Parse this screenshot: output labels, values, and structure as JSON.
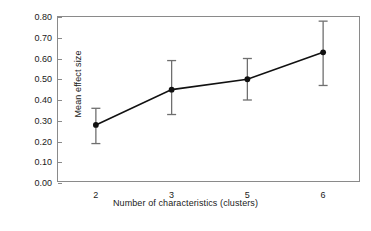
{
  "chart_data": {
    "type": "line",
    "title": "",
    "xlabel": "Number of characteristics (clusters)",
    "ylabel": "Mean effect size",
    "categories": [
      "2",
      "3",
      "5",
      "6"
    ],
    "values": [
      0.28,
      0.45,
      0.5,
      0.63
    ],
    "error_low": [
      0.19,
      0.33,
      0.4,
      0.47
    ],
    "error_high": [
      0.36,
      0.59,
      0.6,
      0.78
    ],
    "ylim": [
      0.0,
      0.8
    ],
    "ytick_values": [
      0.8,
      0.7,
      0.6,
      0.5,
      0.4,
      0.3,
      0.2,
      0.1,
      0.0
    ],
    "ytick_labels": [
      "0.80",
      "0.70",
      "0.60",
      "0.50",
      "0.40",
      "0.30",
      "0.20",
      "0.10",
      "0.00"
    ],
    "grid": false,
    "legend": "none",
    "marker": "filled-circle",
    "error_bars": true,
    "colors": {
      "line": "#111111",
      "marker": "#111111",
      "error_bar": "#6f6f6f",
      "frame": "#8a8a8a",
      "background": "#ffffff",
      "text": "#1a1a1a"
    }
  }
}
